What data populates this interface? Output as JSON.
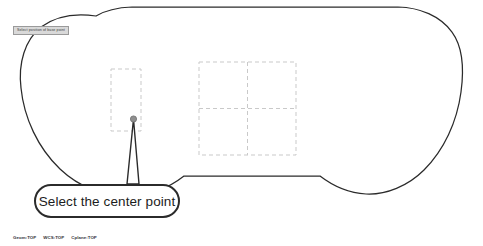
{
  "app": {
    "background_color": "#ffffff",
    "geometry_color": "#2b2b2b",
    "construction_color": "#c9c9c9",
    "point_color": "#8c8c8c",
    "prompt_bg_color": "#d9d9d9"
  },
  "prompt": {
    "label": "Select position of base point"
  },
  "callout": {
    "text": "Select the center point"
  },
  "status": {
    "items": [
      {
        "label": "Geom:TOP"
      },
      {
        "label": "WCS:TOP"
      },
      {
        "label": "Cplane:TOP"
      }
    ]
  },
  "drawing": {
    "profile_name": "rounded-slot-profile",
    "selection_point": {
      "x": 132,
      "y": 119
    },
    "construction_rect_left": {
      "x": 111,
      "y": 69,
      "width": 30,
      "height": 62
    },
    "construction_grid_right": {
      "x": 199,
      "y": 62,
      "width": 97,
      "height": 93,
      "rows": 2,
      "cols": 2
    }
  }
}
